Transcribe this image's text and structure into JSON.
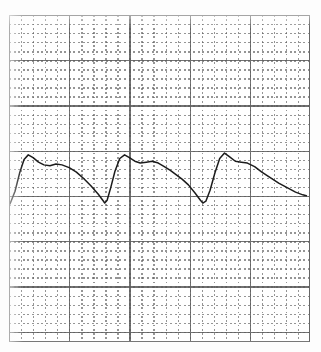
{
  "document": {
    "kind": "scanned-graph-paper-chart",
    "background_color": "#ffffff",
    "paper_color": "#fdfdfd"
  },
  "chart_data": {
    "type": "line",
    "title": "",
    "subtitle": "",
    "xlabel": "",
    "ylabel": "",
    "xlim": [
      0,
      25
    ],
    "ylim": [
      0,
      36
    ],
    "grid": true,
    "legend": null,
    "axis_ticks": {
      "x_major_count": 5,
      "x_minor_per_major": 5,
      "y_major_count": 7,
      "y_minor_per_major": 5,
      "tick_labels_x": [],
      "tick_labels_y": []
    },
    "annotations": [],
    "series": [
      {
        "name": "trace",
        "color": "#1c1c1c",
        "x": [
          0.08,
          0.5,
          0.9,
          1.25,
          1.6,
          2.0,
          2.45,
          2.9,
          3.4,
          3.9,
          4.4,
          5.0,
          5.6,
          6.2,
          6.8,
          7.4,
          7.85,
          7.95,
          8.15,
          8.45,
          8.8,
          9.2,
          9.6,
          10.0,
          10.45,
          10.9,
          11.4,
          11.9,
          12.4,
          12.9,
          13.4,
          13.9,
          14.4,
          14.9,
          15.45,
          15.9,
          16.1,
          16.35,
          16.7,
          17.1,
          17.5,
          17.9,
          18.3,
          18.8,
          19.3,
          19.8,
          20.4,
          21.0,
          21.7,
          22.4,
          23.1,
          23.8,
          24.4,
          24.7
        ],
        "y": [
          15.2,
          16.6,
          18.7,
          20.1,
          20.6,
          20.3,
          19.8,
          19.5,
          19.4,
          19.6,
          19.5,
          19.2,
          18.7,
          18.0,
          17.2,
          16.3,
          15.5,
          15.3,
          15.6,
          17.0,
          18.8,
          20.2,
          20.6,
          20.3,
          19.9,
          19.7,
          19.8,
          19.9,
          19.7,
          19.3,
          18.9,
          18.4,
          17.9,
          17.3,
          16.4,
          15.6,
          15.3,
          15.5,
          16.7,
          18.6,
          20.2,
          20.8,
          20.4,
          19.9,
          19.8,
          19.7,
          19.3,
          18.7,
          18.1,
          17.5,
          17.0,
          16.5,
          16.2,
          16.1
        ]
      }
    ],
    "cycles": 3,
    "waveform_shape": "sawtooth-with-rounded-peak-and-plateau"
  }
}
